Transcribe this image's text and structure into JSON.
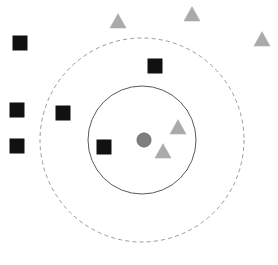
{
  "figure": {
    "title": "",
    "background_color": "#ffffff",
    "width": 278,
    "height": 265
  },
  "chart_data": {
    "type": "scatter",
    "title": "",
    "subtitle": "",
    "xlabel": "",
    "ylabel": "",
    "xlim": [
      0,
      278
    ],
    "ylim": [
      0,
      265
    ],
    "grid": false,
    "legend": null,
    "axes_visible": false,
    "tick_labels": [],
    "annotations": [],
    "center": {
      "name": "cluster-centroid",
      "shape": "circle",
      "x": 144,
      "y": 140,
      "radius": 7,
      "color": "#7f7f7f",
      "edge_color": "#6b6b6b"
    },
    "boundaries": [
      {
        "name": "inner-boundary",
        "shape": "circle",
        "cx": 142,
        "cy": 140,
        "radius": 54,
        "stroke": "#595959",
        "stroke_width": 1,
        "dash": "solid"
      },
      {
        "name": "outer-boundary",
        "shape": "circle",
        "cx": 142,
        "cy": 140,
        "radius": 102,
        "stroke": "#9a9a9a",
        "stroke_width": 1,
        "dash": "dashed"
      }
    ],
    "series": [
      {
        "name": "squares",
        "marker": "square",
        "color": "#111111",
        "edge_color": "#111111",
        "size": 14,
        "count": 6,
        "points": [
          {
            "x": 20,
            "y": 43,
            "region": "outside"
          },
          {
            "x": 17,
            "y": 110,
            "region": "outside"
          },
          {
            "x": 17,
            "y": 146,
            "region": "outside"
          },
          {
            "x": 63,
            "y": 113,
            "region": "outer-ring"
          },
          {
            "x": 155,
            "y": 66,
            "region": "outer-ring"
          },
          {
            "x": 104,
            "y": 147,
            "region": "inner"
          }
        ]
      },
      {
        "name": "triangles",
        "marker": "triangle-up",
        "color": "#aaaaaa",
        "edge_color": "#aaaaaa",
        "size": 16,
        "count": 5,
        "points": [
          {
            "x": 118,
            "y": 22,
            "region": "outside"
          },
          {
            "x": 192,
            "y": 15,
            "region": "outside"
          },
          {
            "x": 262,
            "y": 40,
            "region": "outside"
          },
          {
            "x": 178,
            "y": 128,
            "region": "inner"
          },
          {
            "x": 163,
            "y": 152,
            "region": "inner"
          }
        ]
      }
    ]
  }
}
